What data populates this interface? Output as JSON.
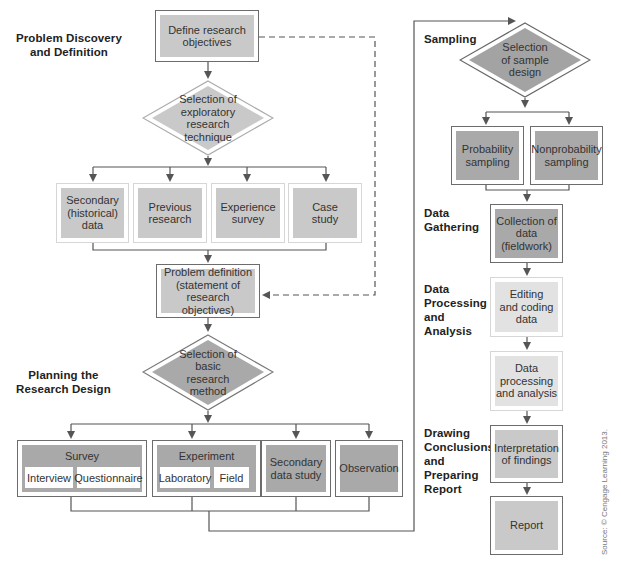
{
  "stages": {
    "problem_discovery": "Problem Discovery and Definition",
    "planning": "Planning the Research Design",
    "sampling": "Sampling",
    "data_gathering": "Data Gathering",
    "data_processing": "Data Processing and Analysis",
    "conclusions": "Drawing Conclusions and Preparing Report"
  },
  "stage_lines": {
    "problem_discovery": [
      "Problem Discovery",
      "and Definition"
    ],
    "planning": [
      "Planning the",
      "Research Design"
    ],
    "data_gathering": [
      "Data",
      "Gathering"
    ],
    "data_processing": [
      "Data",
      "Processing",
      "and",
      "Analysis"
    ],
    "conclusions": [
      "Drawing",
      "Conclusions",
      "and",
      "Preparing",
      "Report"
    ]
  },
  "nodes": {
    "define_objectives": "Define research objectives",
    "exploratory_technique": "Selection of exploratory research technique",
    "secondary_historical": "Secondary (historical) data",
    "previous_research": "Previous research",
    "experience_survey": "Experience survey",
    "case_study": "Case study",
    "problem_definition": "Problem definition (statement of research objectives)",
    "basic_method": "Selection of basic research method",
    "survey": {
      "title": "Survey",
      "options": [
        "Interview",
        "Questionnaire"
      ]
    },
    "experiment": {
      "title": "Experiment",
      "options": [
        "Laboratory",
        "Field"
      ]
    },
    "secondary_data_study": "Secondary data study",
    "observation": "Observation",
    "sample_design": "Selection of sample design",
    "probability_sampling": "Probability sampling",
    "nonprobability_sampling": "Nonprobability sampling",
    "collection": "Collection of data (fieldwork)",
    "editing": "Editing and coding data",
    "processing": "Data processing and analysis",
    "interpretation": "Interpretation of findings",
    "report": "Report"
  },
  "source": "Source: © Cengage Learning 2013.",
  "colors": {
    "line": "#555555",
    "fill_dark": "#a9a9a9",
    "fill_mid": "#c9c9c9",
    "fill_light": "#e2e2e2"
  }
}
